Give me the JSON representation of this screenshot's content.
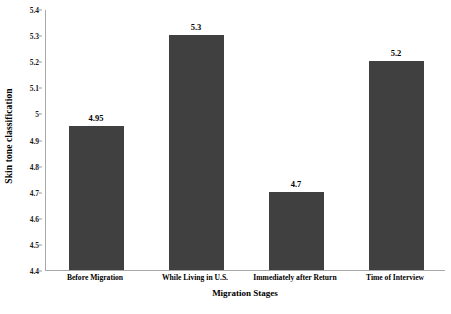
{
  "chart_data": {
    "type": "bar",
    "title": "",
    "xlabel": "Migration Stages",
    "ylabel": "Skin tone classification",
    "categories": [
      "Before Migration",
      "While Living in U.S.",
      "Immediately after Return",
      "Time of Interview"
    ],
    "values": [
      4.95,
      5.3,
      4.7,
      5.2
    ],
    "value_labels": [
      "4.95",
      "5.3",
      "4.7",
      "5.2"
    ],
    "ylim": [
      4.4,
      5.4
    ],
    "ytick_labels": [
      "4.4",
      "4.5",
      "4.6",
      "4.7",
      "4.8",
      "4.9",
      "5",
      "5.1",
      "5.2",
      "5.3",
      "5.4"
    ],
    "ytick_values": [
      4.4,
      4.5,
      4.6,
      4.7,
      4.8,
      4.9,
      5.0,
      5.1,
      5.2,
      5.3,
      5.4
    ],
    "grid": false,
    "legend": false,
    "bar_color": "#404040",
    "axis_color": "#a8a8a8",
    "background_color": "#ffffff"
  }
}
